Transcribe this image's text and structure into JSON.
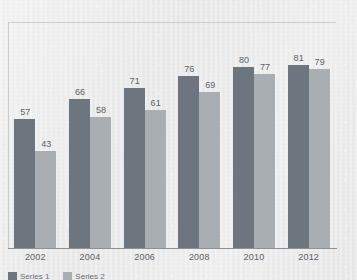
{
  "chart_data": {
    "type": "bar",
    "title": "",
    "subtitle": "",
    "xlabel": "",
    "ylabel": "",
    "categories": [
      "2002",
      "2004",
      "2006",
      "2008",
      "2010",
      "2012"
    ],
    "series": [
      {
        "name": "Series 1",
        "color": "#6d757f",
        "values": [
          57,
          66,
          71,
          76,
          80,
          81
        ]
      },
      {
        "name": "Series 2",
        "color": "#a9aeb3",
        "values": [
          43,
          58,
          61,
          69,
          77,
          79
        ]
      }
    ],
    "ylim": [
      0,
      100
    ],
    "grid": false,
    "legend_position": "bottom-left",
    "data_labels": true,
    "background_color": "#ededee",
    "axis_color": "#8d9095",
    "label_color": "#5e6167"
  },
  "legend": {
    "entries": [
      {
        "label": "Series 1"
      },
      {
        "label": "Series 2"
      }
    ]
  }
}
